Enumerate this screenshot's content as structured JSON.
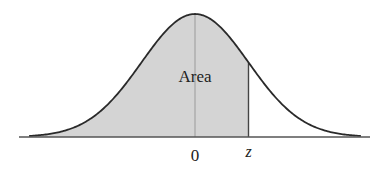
{
  "chart_data": {
    "type": "area",
    "title": "",
    "distribution": {
      "name": "standard normal",
      "mean": 0,
      "sd": 1
    },
    "x_range": [
      -3.1,
      3.1
    ],
    "shade_from": -3.1,
    "shade_to": 1.0,
    "labels": {
      "area": "Area",
      "zero_tick": "0",
      "z_tick": "z"
    },
    "colors": {
      "shade": "#d4d4d4",
      "curve": "#2a2a2a",
      "axis": "#555555",
      "mean_line": "#9a9a9a"
    }
  }
}
